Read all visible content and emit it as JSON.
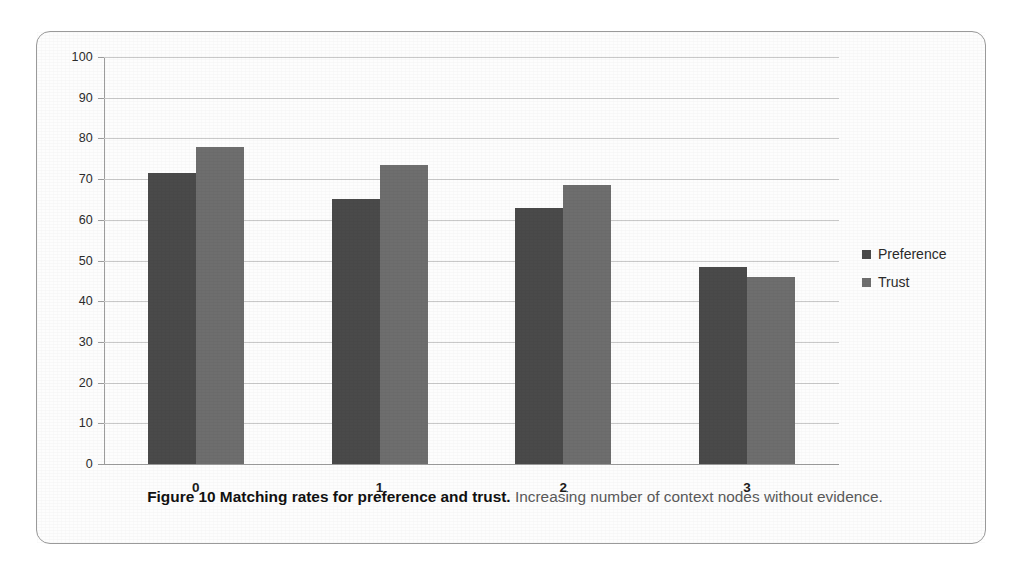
{
  "figure": {
    "caption_title": "Figure 10 Matching rates for preference and trust.",
    "caption_rest": " Increasing number of context nodes without evidence."
  },
  "colors": {
    "series_preference": "#4a4a4a",
    "series_trust": "#6e6e6e",
    "gridline": "#c9c9c9",
    "axis": "#9d9d9d",
    "frame_border": "#9a9a9a",
    "background": "#fdfdfd"
  },
  "legend": {
    "position": "right",
    "entries": [
      {
        "label": "Preference",
        "color": "#4a4a4a",
        "swatch": "legend-swatch-square"
      },
      {
        "label": "Trust",
        "color": "#6e6e6e",
        "swatch": "legend-swatch-square"
      }
    ]
  },
  "axes": {
    "y_tick_labels": [
      "100",
      "90",
      "80",
      "70",
      "60",
      "50",
      "40",
      "30",
      "20",
      "10",
      "0"
    ],
    "x_tick_labels": [
      "0",
      "1",
      "2",
      "3"
    ]
  },
  "chart_data": {
    "type": "bar",
    "title": "",
    "subtitle": "",
    "xlabel": "",
    "ylabel": "",
    "categories": [
      "0",
      "1",
      "2",
      "3"
    ],
    "series": [
      {
        "name": "Preference",
        "color": "#4a4a4a",
        "values": [
          71.5,
          65.0,
          63.0,
          48.5
        ]
      },
      {
        "name": "Trust",
        "color": "#6e6e6e",
        "values": [
          78.0,
          73.5,
          68.5,
          46.0
        ]
      }
    ],
    "ylim": [
      0,
      100
    ],
    "yticks": [
      0,
      10,
      20,
      30,
      40,
      50,
      60,
      70,
      80,
      90,
      100
    ],
    "grid": true,
    "legend_position": "right",
    "annotations": []
  }
}
